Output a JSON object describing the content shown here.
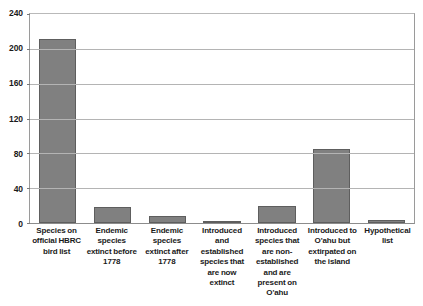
{
  "chart_data": {
    "type": "bar",
    "title": "",
    "xlabel": "",
    "ylabel": "",
    "ylim": [
      0,
      240
    ],
    "yticks": [
      0,
      40,
      80,
      120,
      160,
      200,
      240
    ],
    "grid": true,
    "legend": false,
    "bar_color": "#808080",
    "bar_border_color": "#5e5e5e",
    "categories": [
      "Species on official HBRC bird list",
      "Endemic species extinct before 1778",
      "Endemic species extinct after 1778",
      "Introduced and established species that are now extinct",
      "Introduced species that are non-established and are present on O'ahu",
      "Introduced to O'ahu but extirpated on the island",
      "Hypothetical list"
    ],
    "values": [
      211,
      18,
      8,
      1,
      19,
      85,
      3
    ]
  }
}
